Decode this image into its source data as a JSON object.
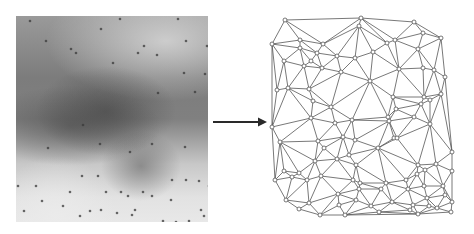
{
  "figure": {
    "source_image": {
      "colors": {
        "dot": "#3a3a3a"
      },
      "sample_points": [
        [
          14,
          5
        ],
        [
          30,
          25
        ],
        [
          85,
          13
        ],
        [
          104,
          3
        ],
        [
          162,
          3
        ],
        [
          170,
          25
        ],
        [
          191,
          30
        ],
        [
          128,
          30
        ],
        [
          141,
          39
        ],
        [
          55,
          33
        ],
        [
          60,
          37
        ],
        [
          97,
          47
        ],
        [
          122,
          37
        ],
        [
          168,
          57
        ],
        [
          189,
          58
        ],
        [
          201,
          66
        ],
        [
          179,
          76
        ],
        [
          142,
          77
        ],
        [
          67,
          109
        ],
        [
          32,
          132
        ],
        [
          84,
          128
        ],
        [
          114,
          136
        ],
        [
          136,
          128
        ],
        [
          169,
          131
        ],
        [
          2,
          170
        ],
        [
          20,
          170
        ],
        [
          66,
          160
        ],
        [
          82,
          160
        ],
        [
          105,
          176
        ],
        [
          112,
          180
        ],
        [
          136,
          180
        ],
        [
          127,
          176
        ],
        [
          156,
          164
        ],
        [
          170,
          164
        ],
        [
          183,
          165
        ],
        [
          193,
          170
        ],
        [
          194,
          178
        ],
        [
          54,
          176
        ],
        [
          90,
          176
        ],
        [
          101,
          197
        ],
        [
          8,
          195
        ],
        [
          26,
          185
        ],
        [
          47,
          190
        ],
        [
          64,
          200
        ],
        [
          35,
          210
        ],
        [
          74,
          195
        ],
        [
          85,
          194
        ],
        [
          116,
          199
        ],
        [
          119,
          194
        ],
        [
          123,
          209
        ],
        [
          147,
          205
        ],
        [
          160,
          206
        ],
        [
          173,
          205
        ],
        [
          195,
          207
        ],
        [
          180,
          214
        ],
        [
          186,
          219
        ],
        [
          99,
          208
        ],
        [
          93,
          213
        ],
        [
          8,
          210
        ],
        [
          155,
          184
        ],
        [
          185,
          194
        ],
        [
          188,
          200
        ]
      ]
    },
    "arrow": {
      "color": "#2a2a2a",
      "from_x": 213,
      "to_x": 266,
      "y": 122
    },
    "mesh": {
      "colors": {
        "edge": "#555555",
        "node_fill": "#ffffff",
        "node_stroke": "#555555"
      },
      "nodes": [
        [
          285,
          20
        ],
        [
          361,
          18
        ],
        [
          414,
          22
        ],
        [
          300,
          40
        ],
        [
          359,
          26
        ],
        [
          423,
          33
        ],
        [
          441,
          38
        ],
        [
          272,
          44
        ],
        [
          300,
          48
        ],
        [
          323,
          44
        ],
        [
          387,
          43
        ],
        [
          395,
          40
        ],
        [
          418,
          49
        ],
        [
          434,
          70
        ],
        [
          317,
          53
        ],
        [
          337,
          56
        ],
        [
          355,
          58
        ],
        [
          373,
          52
        ],
        [
          311,
          61
        ],
        [
          322,
          68
        ],
        [
          284,
          61
        ],
        [
          304,
          66
        ],
        [
          341,
          72
        ],
        [
          399,
          69
        ],
        [
          423,
          68
        ],
        [
          445,
          77
        ],
        [
          288,
          88
        ],
        [
          309,
          89
        ],
        [
          277,
          90
        ],
        [
          370,
          81
        ],
        [
          424,
          97
        ],
        [
          441,
          94
        ],
        [
          331,
          107
        ],
        [
          313,
          101
        ],
        [
          393,
          97
        ],
        [
          421,
          104
        ],
        [
          430,
          100
        ],
        [
          311,
          118
        ],
        [
          272,
          127
        ],
        [
          318,
          141
        ],
        [
          343,
          137
        ],
        [
          355,
          140
        ],
        [
          349,
          155
        ],
        [
          389,
          121
        ],
        [
          394,
          138
        ],
        [
          397,
          138
        ],
        [
          452,
          152
        ],
        [
          324,
          148
        ],
        [
          280,
          142
        ],
        [
          315,
          161
        ],
        [
          299,
          173
        ],
        [
          337,
          159
        ],
        [
          356,
          165
        ],
        [
          378,
          148
        ],
        [
          284,
          171
        ],
        [
          321,
          176
        ],
        [
          353,
          180
        ],
        [
          360,
          183
        ],
        [
          386,
          183
        ],
        [
          418,
          165
        ],
        [
          417,
          174
        ],
        [
          425,
          170
        ],
        [
          436,
          164
        ],
        [
          452,
          171
        ],
        [
          406,
          180
        ],
        [
          408,
          189
        ],
        [
          424,
          186
        ],
        [
          443,
          186
        ],
        [
          275,
          180
        ],
        [
          292,
          177
        ],
        [
          307,
          180
        ],
        [
          338,
          194
        ],
        [
          359,
          189
        ],
        [
          381,
          189
        ],
        [
          413,
          205
        ],
        [
          427,
          198
        ],
        [
          445,
          195
        ],
        [
          452,
          202
        ],
        [
          286,
          200
        ],
        [
          309,
          203
        ],
        [
          339,
          205
        ],
        [
          356,
          200
        ],
        [
          371,
          206
        ],
        [
          392,
          202
        ],
        [
          410,
          210
        ],
        [
          429,
          206
        ],
        [
          437,
          208
        ],
        [
          418,
          214
        ],
        [
          451,
          212
        ],
        [
          379,
          212
        ],
        [
          345,
          215
        ],
        [
          299,
          209
        ],
        [
          320,
          215
        ],
        [
          388,
          117
        ],
        [
          430,
          124
        ],
        [
          414,
          117
        ],
        [
          396,
          109
        ],
        [
          352,
          120
        ],
        [
          335,
          123
        ]
      ]
    }
  }
}
